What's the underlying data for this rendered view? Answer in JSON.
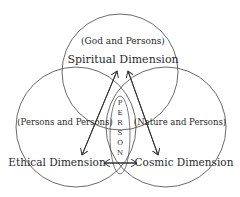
{
  "diagram": {
    "circles": [
      {
        "id": "spiritual",
        "title": "Spiritual Dimension",
        "subtitle": "(God and Persons)"
      },
      {
        "id": "ethical",
        "title": "Ethical Dimension",
        "subtitle": "(Persons and Persons)"
      },
      {
        "id": "cosmic",
        "title": "Cosmic Dimension",
        "subtitle": "(Nature and Persons)"
      }
    ],
    "center_label": [
      "P",
      "E",
      "R",
      "S",
      "O",
      "N"
    ],
    "colors": {
      "line": "#333333",
      "background": "#ffffff"
    }
  }
}
